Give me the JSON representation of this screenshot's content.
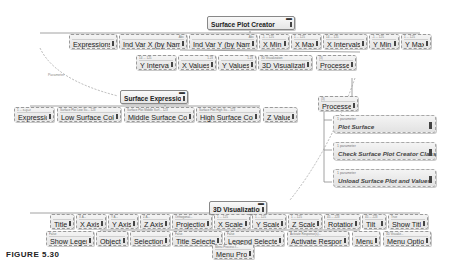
{
  "root": {
    "label": "Surface Plot Creator"
  },
  "row1": [
    {
      "label": "Expressions",
      "hdr": ""
    },
    {
      "label": "Ind Var X (by Name)",
      "hdr": "Abc"
    },
    {
      "label": "Ind Var Y (by Name)",
      "hdr": "Abc"
    },
    {
      "label": "X Min",
      "hdr": "-1 ... 125"
    },
    {
      "label": "X Max",
      "hdr": "1 ... 125"
    },
    {
      "label": "X Intervals",
      "hdr": "14 ... 125"
    },
    {
      "label": "Y Min",
      "hdr": "-1 ... 125"
    },
    {
      "label": "Y Max",
      "hdr": "1 ... 125"
    }
  ],
  "row2": [
    {
      "label": "Y Intervals",
      "hdr": "14 ... 125"
    },
    {
      "label": "X Values",
      "hdr": "1.23"
    },
    {
      "label": "Y Values",
      "hdr": "1.23"
    },
    {
      "label": "3D Visualization",
      "hdr": "3D Visualization"
    },
    {
      "label": "Processes",
      "hdr": "(3)"
    }
  ],
  "connector_label": "Parameter",
  "surface_expression": {
    "label": "Surface Expression"
  },
  "row3": [
    {
      "label": "Expression",
      "hdr": "1 ... x+y+z"
    },
    {
      "label": "Low Surface Color",
      "hdr": "Surface Plot Low Su... 123"
    },
    {
      "label": "Middle Surface Color",
      "hdr": "Surface Plot Middle Surf... 123"
    },
    {
      "label": "High Surface Color",
      "hdr": "Surface Plot High Su... 123"
    },
    {
      "label": "Z Values",
      "hdr": ""
    }
  ],
  "processes_node": {
    "label": "Processes",
    "hdr": "(3)"
  },
  "process_items": [
    {
      "hdr": "1 parameter",
      "label": "Plot Surface"
    },
    {
      "hdr": "1 parameter",
      "label": "Check Surface Plot Creator Class"
    },
    {
      "hdr": "1 parameter",
      "label": "Unload Surface Plot and Values"
    }
  ],
  "viz_node": {
    "label": "3D Visualization"
  },
  "row4": [
    {
      "label": "Title",
      "hdr": ""
    },
    {
      "label": "X Axis",
      "hdr": "X A..."
    },
    {
      "label": "Y Axis",
      "hdr": "Y A..."
    },
    {
      "label": "Z Axis",
      "hdr": "Z A..."
    },
    {
      "label": "Projection",
      "hdr": "Orthogonal..."
    },
    {
      "label": "X Scale",
      "hdr": "1 ... 125"
    },
    {
      "label": "Y Scale",
      "hdr": "1 ... 125"
    },
    {
      "label": "Z Scale",
      "hdr": "1 ... 125"
    },
    {
      "label": "Rotation",
      "hdr": "45 ... 223"
    },
    {
      "label": "Tilt",
      "hdr": "45 ... 223"
    },
    {
      "label": "Show Title",
      "hdr": "True"
    }
  ],
  "row5": [
    {
      "label": "Show Legend",
      "hdr": "False"
    },
    {
      "label": "Objects",
      "hdr": ""
    },
    {
      "label": "Selections",
      "hdr": ""
    },
    {
      "label": "Title Selected",
      "hdr": "False"
    },
    {
      "label": "Legend Selected",
      "hdr": "False"
    },
    {
      "label": "Activate Response",
      "hdr": "Activate Response(s)..."
    },
    {
      "label": "Menu",
      "hdr": ""
    },
    {
      "label": "Menu Options",
      "hdr": "3D Visualiz..."
    }
  ],
  "menu_process": {
    "label": "Menu Process",
    "hdr": "Menu Process f..."
  },
  "figure": {
    "label": "FIGURE 5.30"
  }
}
